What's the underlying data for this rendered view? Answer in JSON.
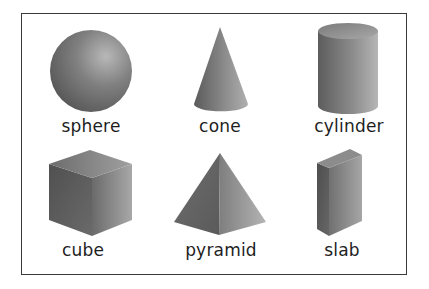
{
  "figure": {
    "shapes": [
      {
        "id": "sphere",
        "label": "sphere"
      },
      {
        "id": "cone",
        "label": "cone"
      },
      {
        "id": "cylinder",
        "label": "cylinder"
      },
      {
        "id": "cube",
        "label": "cube"
      },
      {
        "id": "pyramid",
        "label": "pyramid"
      },
      {
        "id": "slab",
        "label": "slab"
      }
    ],
    "colors": {
      "border": "#3a3a3a",
      "shade_dark": "#555555",
      "shade_light": "#b5b5b5",
      "text": "#1e1e1e"
    }
  }
}
